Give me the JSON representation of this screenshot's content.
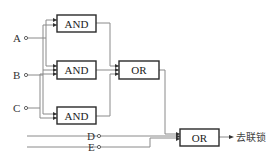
{
  "diagram": {
    "type": "logic-circuit",
    "inputs": [
      {
        "id": "A",
        "label": "A"
      },
      {
        "id": "B",
        "label": "B"
      },
      {
        "id": "C",
        "label": "C"
      },
      {
        "id": "D",
        "label": "D"
      },
      {
        "id": "E",
        "label": "E"
      }
    ],
    "gates": [
      {
        "id": "and1",
        "label": "AND",
        "inputs": [
          "A",
          "B"
        ]
      },
      {
        "id": "and2",
        "label": "AND",
        "inputs": [
          "A",
          "B",
          "C"
        ]
      },
      {
        "id": "and3",
        "label": "AND",
        "inputs": [
          "B",
          "C"
        ]
      },
      {
        "id": "or1",
        "label": "OR",
        "inputs": [
          "and1",
          "and2",
          "and3"
        ]
      },
      {
        "id": "or2",
        "label": "OR",
        "inputs": [
          "or1",
          "D",
          "E"
        ]
      }
    ],
    "output": {
      "label": "去联锁"
    }
  }
}
